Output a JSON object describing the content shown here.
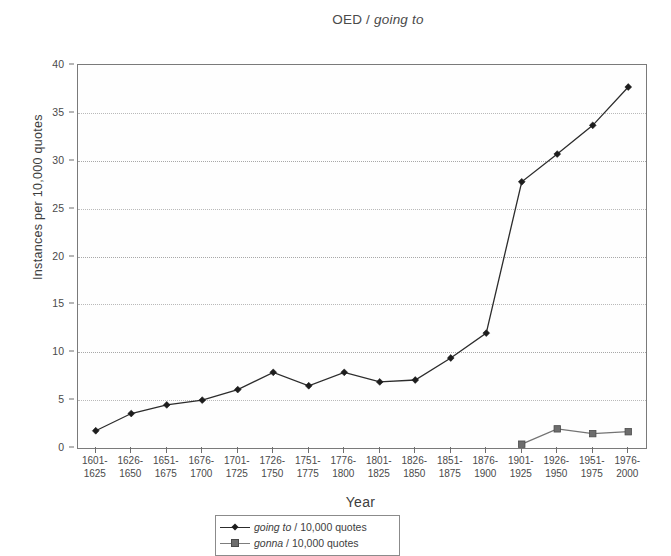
{
  "chart_data": {
    "type": "line",
    "title": "OED / going to",
    "title_plain": "OED / ",
    "title_italic": "going to",
    "xlabel": "Year",
    "ylabel": "Instances per 10,000 quotes",
    "ylim": [
      0,
      40
    ],
    "yticks": [
      0,
      5,
      10,
      15,
      20,
      25,
      30,
      35,
      40
    ],
    "grid": true,
    "legend_position": "bottom",
    "categories": [
      "1601-\n1625",
      "1626-\n1650",
      "1651-\n1675",
      "1676-\n1700",
      "1701-\n1725",
      "1726-\n1750",
      "1751-\n1775",
      "1776-\n1800",
      "1801-\n1825",
      "1826-\n1850",
      "1851-\n1875",
      "1876-\n1900",
      "1901-\n1925",
      "1926-\n1950",
      "1951-\n1975",
      "1976-\n2000"
    ],
    "category_lines": [
      [
        "1601-",
        "1625"
      ],
      [
        "1626-",
        "1650"
      ],
      [
        "1651-",
        "1675"
      ],
      [
        "1676-",
        "1700"
      ],
      [
        "1701-",
        "1725"
      ],
      [
        "1726-",
        "1750"
      ],
      [
        "1751-",
        "1775"
      ],
      [
        "1776-",
        "1800"
      ],
      [
        "1801-",
        "1825"
      ],
      [
        "1826-",
        "1850"
      ],
      [
        "1851-",
        "1875"
      ],
      [
        "1876-",
        "1900"
      ],
      [
        "1901-",
        "1925"
      ],
      [
        "1926-",
        "1950"
      ],
      [
        "1951-",
        "1975"
      ],
      [
        "1976-",
        "2000"
      ]
    ],
    "series": [
      {
        "name": "going to / 10,000 quotes",
        "name_italic": "going to",
        "name_rest": " / 10,000 quotes",
        "marker": "diamond",
        "color": "#1d1d1d",
        "values": [
          1.8,
          3.6,
          4.5,
          5.0,
          6.1,
          7.9,
          6.5,
          7.9,
          6.9,
          7.1,
          9.4,
          12.0,
          27.8,
          30.7,
          33.7,
          37.7
        ]
      },
      {
        "name": "gonna / 10,000 quotes",
        "name_italic": "gonna",
        "name_rest": " / 10,000 quotes",
        "marker": "square",
        "color": "#6d6d6d",
        "values": [
          null,
          null,
          null,
          null,
          null,
          null,
          null,
          null,
          null,
          null,
          null,
          null,
          0.4,
          2.0,
          1.5,
          1.7
        ]
      }
    ]
  },
  "legend": {
    "entries": [
      {
        "italic": "going to",
        "rest": " / 10,000 quotes"
      },
      {
        "italic": "gonna",
        "rest": " / 10,000 quotes"
      }
    ]
  }
}
